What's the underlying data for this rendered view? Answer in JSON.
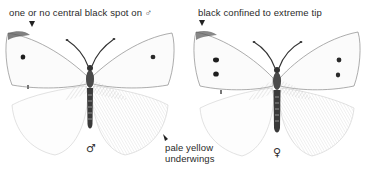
{
  "figure": {
    "male": {
      "annotation": "one or no central black spot on ♂",
      "sex_symbol": "♂",
      "underside_annotation": [
        "pale yellow",
        "underwings"
      ]
    },
    "female": {
      "annotation": "black confined to extreme tip",
      "sex_symbol": "♀"
    },
    "colors": {
      "ink": "#2a2a2a",
      "wing_fill": "#fafafa",
      "wing_line": "#9a9a9a",
      "spot": "#1e1e1e",
      "body": "#3a3a3a"
    }
  }
}
